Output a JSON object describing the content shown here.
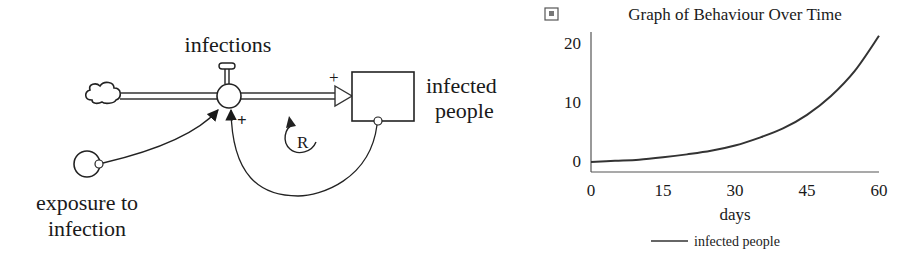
{
  "diagram": {
    "flow_label": "infections",
    "stock_label_line1": "infected",
    "stock_label_line2": "people",
    "converter_label_line1": "exposure to",
    "converter_label_line2": "infection",
    "flow_polarity": "+",
    "link1_polarity": "+",
    "loop_label": "R",
    "loop_type": "reinforcing"
  },
  "chart_data": {
    "type": "line",
    "title": "Graph of Behaviour Over Time",
    "xlabel": "days",
    "ylabel": "",
    "xlim": [
      0,
      60
    ],
    "ylim": [
      0,
      20
    ],
    "x_ticks": [
      "0",
      "15",
      "30",
      "45",
      "60"
    ],
    "y_ticks": [
      "0",
      "10",
      "20"
    ],
    "grid": false,
    "legend_position": "bottom",
    "series": [
      {
        "name": "infected people",
        "x": [
          0,
          5,
          10,
          15,
          20,
          25,
          30,
          35,
          40,
          45,
          50,
          55,
          60
        ],
        "values": [
          0.5,
          0.7,
          0.9,
          1.3,
          1.8,
          2.4,
          3.3,
          4.6,
          6.2,
          8.5,
          11.7,
          16.0,
          21.9
        ]
      }
    ]
  }
}
